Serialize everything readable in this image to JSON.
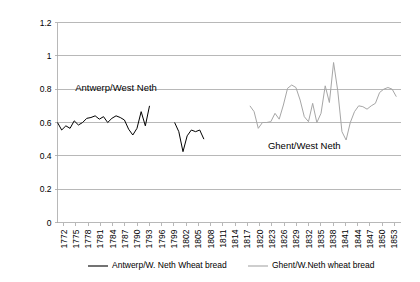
{
  "chart_data": {
    "type": "line",
    "title": "",
    "xlabel": "",
    "ylabel": "",
    "ylim": [
      0,
      1.2
    ],
    "yticks": [
      0,
      0.2,
      0.4,
      0.6,
      0.8,
      1,
      1.2
    ],
    "ytick_labels": [
      "0",
      "0.2",
      "0.4",
      "0.6",
      "0.8",
      "1",
      "1.2"
    ],
    "grid": true,
    "legend_position": "bottom",
    "xlim": [
      1772,
      1854
    ],
    "xtick_labels": [
      "1772",
      "1775",
      "1778",
      "1781",
      "1784",
      "1787",
      "1790",
      "1793",
      "1796",
      "1799",
      "1802",
      "1805",
      "1808",
      "1811",
      "1814",
      "1817",
      "1820",
      "1823",
      "1826",
      "1829",
      "1832",
      "1835",
      "1838",
      "1841",
      "1844",
      "1847",
      "1850",
      "1853"
    ],
    "annotations": [
      {
        "text": "Antwerp/West Neth",
        "x": 1786,
        "y": 0.79
      },
      {
        "text": "Ghent/West Neth",
        "x": 1831,
        "y": 0.44
      }
    ],
    "series": [
      {
        "name": "Antwerp/W. Neth Wheat bread",
        "color": "#000000",
        "legend_label": "Antwerp/W. Neth Wheat bread",
        "x": [
          1772,
          1773,
          1774,
          1775,
          1776,
          1777,
          1778,
          1779,
          1780,
          1781,
          1782,
          1783,
          1784,
          1785,
          1786,
          1787,
          1788,
          1789,
          1790,
          1791,
          1792,
          1793,
          1794,
          1800,
          1801,
          1802,
          1803,
          1804,
          1805,
          1806,
          1807
        ],
        "values": [
          0.6,
          0.555,
          0.58,
          0.565,
          0.61,
          0.585,
          0.6,
          0.625,
          0.63,
          0.64,
          0.62,
          0.635,
          0.6,
          0.625,
          0.64,
          0.63,
          0.615,
          0.56,
          0.525,
          0.565,
          0.665,
          0.58,
          0.7,
          0.6,
          0.545,
          0.425,
          0.52,
          0.555,
          0.545,
          0.555,
          0.5
        ]
      },
      {
        "name": "Ghent/W.Neth wheat bread",
        "color": "#a6a6a6",
        "legend_label": "Ghent/W.Neth wheat bread",
        "x": [
          1818,
          1819,
          1820,
          1821,
          1822,
          1823,
          1824,
          1825,
          1826,
          1827,
          1828,
          1829,
          1830,
          1831,
          1832,
          1833,
          1834,
          1835,
          1836,
          1837,
          1838,
          1839,
          1840,
          1841,
          1842,
          1843,
          1844,
          1845,
          1846,
          1847,
          1848,
          1849,
          1850,
          1851,
          1852,
          1853
        ],
        "values": [
          0.7,
          0.665,
          0.565,
          0.6,
          0.6,
          0.605,
          0.655,
          0.62,
          0.705,
          0.805,
          0.825,
          0.81,
          0.735,
          0.635,
          0.605,
          0.715,
          0.6,
          0.655,
          0.82,
          0.72,
          0.96,
          0.79,
          0.545,
          0.495,
          0.6,
          0.665,
          0.7,
          0.695,
          0.68,
          0.7,
          0.715,
          0.78,
          0.8,
          0.81,
          0.8,
          0.755
        ]
      }
    ]
  }
}
